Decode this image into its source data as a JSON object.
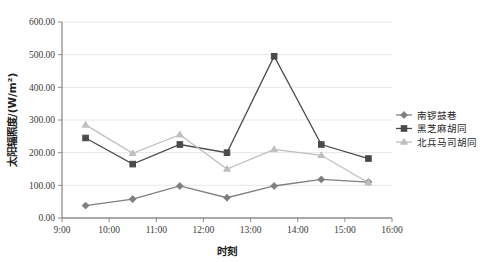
{
  "chart_data": {
    "type": "line",
    "title": "",
    "xlabel": "时刻",
    "ylabel": "太阳辐照度/(W/m²)",
    "x": [
      "9:30",
      "10:30",
      "11:30",
      "12:30",
      "13:30",
      "14:30",
      "15:30"
    ],
    "xlim": [
      9,
      16
    ],
    "ylim": [
      0,
      600
    ],
    "y_ticks": [
      "0.00",
      "100.00",
      "200.00",
      "300.00",
      "400.00",
      "500.00",
      "600.00"
    ],
    "y_tick_values": [
      0,
      100,
      200,
      300,
      400,
      500,
      600
    ],
    "x_ticks": [
      "9:00",
      "10:00",
      "11:00",
      "12:00",
      "13:00",
      "14:00",
      "15:00",
      "16:00"
    ],
    "x_tick_values": [
      9,
      10,
      11,
      12,
      13,
      14,
      15,
      16
    ],
    "grid": true,
    "legend_position": "right",
    "series": [
      {
        "name": "南锣鼓巷",
        "color": "#7f7f7f",
        "marker": "diamond",
        "values": [
          38,
          58,
          98,
          62,
          98,
          118,
          110
        ]
      },
      {
        "name": "黑芝麻胡同",
        "color": "#4a4a4a",
        "marker": "square",
        "values": [
          245,
          165,
          225,
          200,
          495,
          225,
          182
        ]
      },
      {
        "name": "北兵马司胡同",
        "color": "#bfbfbf",
        "marker": "triangle",
        "values": [
          285,
          198,
          255,
          150,
          210,
          192,
          108
        ]
      }
    ]
  },
  "legend": {
    "items": [
      {
        "label": "南锣鼓巷",
        "color": "#7f7f7f",
        "marker": "diamond"
      },
      {
        "label": "黑芝麻胡同",
        "color": "#4a4a4a",
        "marker": "square"
      },
      {
        "label": "北兵马司胡同",
        "color": "#bfbfbf",
        "marker": "triangle"
      }
    ]
  }
}
